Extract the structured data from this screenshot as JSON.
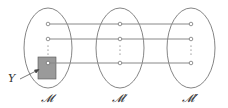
{
  "diagram": {
    "sets": [
      {
        "id": "M",
        "label": "𝓜",
        "cx": 48
      },
      {
        "id": "M1",
        "label": "𝓜′",
        "cx": 120
      },
      {
        "id": "M2",
        "label": "𝓜″",
        "cx": 191
      }
    ],
    "rows_y": [
      24,
      39,
      63
    ],
    "subset_label": "Y",
    "colors": {
      "stroke": "#555555",
      "line": "#888888",
      "box": "#999999"
    }
  }
}
